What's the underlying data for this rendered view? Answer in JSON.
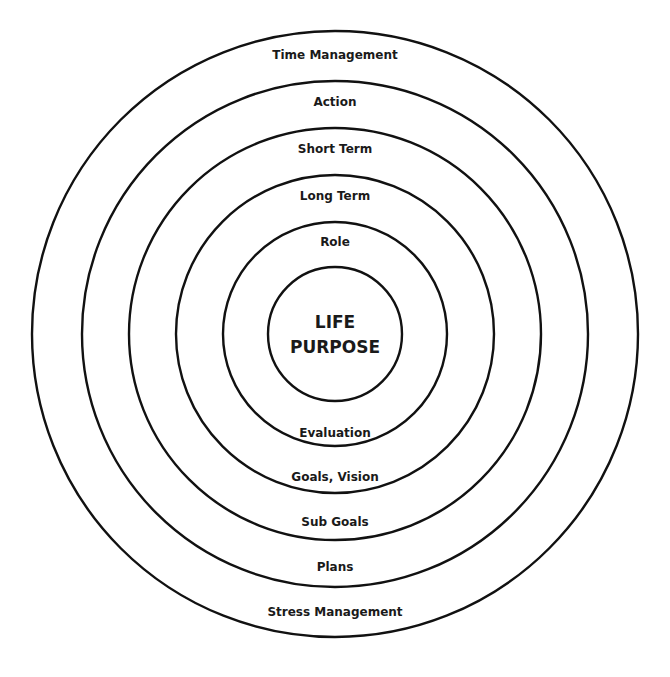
{
  "diagram": {
    "type": "concentric-circles",
    "center": {
      "line1": "LIFE",
      "line2": "PURPOSE"
    },
    "rings": [
      {
        "level": 1,
        "top_label": "Role",
        "bottom_label": "Evaluation"
      },
      {
        "level": 2,
        "top_label": "Long Term",
        "bottom_label": "Goals, Vision"
      },
      {
        "level": 3,
        "top_label": "Short Term",
        "bottom_label": "Sub Goals"
      },
      {
        "level": 4,
        "top_label": "Action",
        "bottom_label": "Plans"
      },
      {
        "level": 5,
        "top_label": "Time Management",
        "bottom_label": "Stress Management"
      }
    ],
    "colors": {
      "stroke": "#111111",
      "text": "#1a1a1a",
      "background": "#ffffff"
    }
  }
}
